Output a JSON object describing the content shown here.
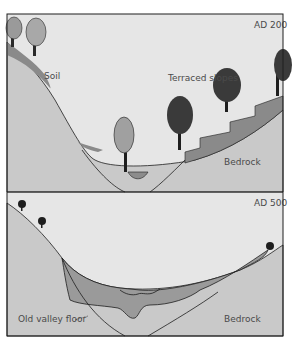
{
  "diagram": {
    "type": "cross-section",
    "panels": [
      {
        "id": "top",
        "era_label": "AD 200",
        "labels": {
          "soil": "Soil",
          "terraced": "Terraced slopes",
          "bedrock": "Bedrock"
        }
      },
      {
        "id": "bottom",
        "era_label": "AD 500",
        "labels": {
          "old_floor": "Old valley floor",
          "bedrock": "Bedrock"
        }
      }
    ],
    "colors": {
      "sky": "#e6e6e6",
      "bedrock": "#c9c9c9",
      "soil": "#8a8a8a",
      "sediment": "#9a9a9a",
      "water": "#8c8c8c",
      "outline": "#1e1e1e",
      "tree": "#2a2a2a"
    }
  }
}
